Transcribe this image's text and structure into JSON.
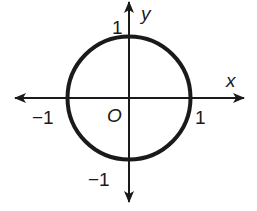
{
  "diagram": {
    "type": "unit-circle",
    "axes": {
      "x_label": "x",
      "y_label": "y",
      "origin_label": "O"
    },
    "ticks": {
      "x_positive": "1",
      "x_negative": "−1",
      "y_positive": "1",
      "y_negative": "−1"
    },
    "circle": {
      "center": [
        0,
        0
      ],
      "radius": 1
    },
    "colors": {
      "stroke": "#1a1a1a",
      "background": "#ffffff"
    }
  }
}
